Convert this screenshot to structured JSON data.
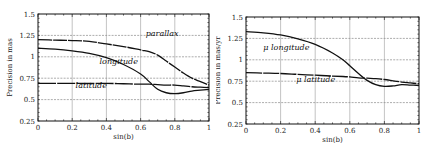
{
  "chart_data": [
    {
      "type": "line",
      "title": "",
      "xlabel": "sin(b)",
      "ylabel": "Precision in mas",
      "xlim": [
        0,
        1
      ],
      "ylim": [
        0.25,
        1.5
      ],
      "xticks": [
        "0",
        "0.2",
        "0.4",
        "0.6",
        "0.8",
        "1"
      ],
      "yticks": [
        "0.25",
        "0.5",
        "0.75",
        "1",
        "1.25",
        "1.5"
      ],
      "grid": true,
      "x": [
        0,
        0.1,
        0.2,
        0.3,
        0.4,
        0.5,
        0.6,
        0.65,
        0.7,
        0.75,
        0.8,
        0.85,
        0.9,
        0.95,
        1.0
      ],
      "series": [
        {
          "name": "parallax",
          "values": [
            1.2,
            1.195,
            1.19,
            1.18,
            1.15,
            1.12,
            1.08,
            1.06,
            1.02,
            0.95,
            0.88,
            0.81,
            0.75,
            0.71,
            0.67
          ]
        },
        {
          "name": "longitude",
          "values": [
            1.1,
            1.09,
            1.07,
            1.04,
            0.99,
            0.91,
            0.8,
            0.71,
            0.62,
            0.58,
            0.57,
            0.58,
            0.6,
            0.61,
            0.62
          ]
        },
        {
          "name": "latitude",
          "values": [
            0.69,
            0.69,
            0.69,
            0.69,
            0.69,
            0.685,
            0.68,
            0.68,
            0.675,
            0.67,
            0.67,
            0.66,
            0.65,
            0.645,
            0.64
          ]
        }
      ],
      "annotations": [
        {
          "text": "parallax",
          "x": 0.63,
          "y": 1.24
        },
        {
          "text": "longitude",
          "x": 0.36,
          "y": 0.92
        },
        {
          "text": "latitude",
          "x": 0.22,
          "y": 0.64
        }
      ]
    },
    {
      "type": "line",
      "title": "",
      "xlabel": "sin(b)",
      "ylabel": "Precision in mas/yr",
      "xlim": [
        0,
        1
      ],
      "ylim": [
        0.25,
        1.5
      ],
      "xticks": [
        "0",
        "0.2",
        "0.4",
        "0.6",
        "0.8",
        "1"
      ],
      "yticks": [
        "0.25",
        "0.5",
        "0.75",
        "1",
        "1.25",
        "1.5"
      ],
      "grid": true,
      "x": [
        0,
        0.1,
        0.2,
        0.3,
        0.4,
        0.5,
        0.56,
        0.6,
        0.65,
        0.7,
        0.75,
        0.8,
        0.85,
        0.9,
        0.95,
        1.0
      ],
      "series": [
        {
          "name": "μ longitude",
          "values": [
            1.33,
            1.315,
            1.29,
            1.245,
            1.18,
            1.08,
            1.0,
            0.93,
            0.84,
            0.76,
            0.71,
            0.69,
            0.695,
            0.71,
            0.705,
            0.7
          ]
        },
        {
          "name": "μ latitude",
          "values": [
            0.85,
            0.845,
            0.84,
            0.83,
            0.82,
            0.81,
            0.805,
            0.8,
            0.79,
            0.785,
            0.78,
            0.77,
            0.755,
            0.74,
            0.73,
            0.72
          ]
        }
      ],
      "annotations": [
        {
          "text": "μ longitude",
          "x": 0.1,
          "y": 1.12
        },
        {
          "text": "μ latitude",
          "x": 0.29,
          "y": 0.74
        }
      ]
    }
  ],
  "panels": {
    "left": {
      "ylabel": "Precision in mas",
      "xlabel": "sin(b)",
      "labels": {
        "parallax": "parallax",
        "longitude": "longitude",
        "latitude": "latitude"
      }
    },
    "right": {
      "ylabel": "Precision in mas/yr",
      "xlabel": "sin(b)",
      "labels": {
        "mu_longitude": "μ longitude",
        "mu_latitude": "μ latitude"
      }
    }
  }
}
